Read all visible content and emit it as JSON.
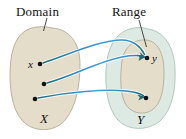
{
  "figure": {
    "type": "mapping-diagram",
    "title_labels": {
      "domain": "Domain",
      "range": "Range"
    },
    "set_labels": {
      "x_set": "X",
      "y_set": "Y"
    },
    "point_labels": {
      "x_point": "x",
      "y_point": "y"
    },
    "colors": {
      "domain_fill": "#e4ddca",
      "domain_stroke": "#b3ab94",
      "codomain_fill": "#dceae3",
      "codomain_stroke": "#a8c4ba",
      "range_fill": "#e4ddca",
      "range_stroke": "#b3ab94",
      "arrow_blue": "#3d9fd6",
      "arrow_teal": "#1d6b75",
      "dot": "#111111",
      "text": "#111111",
      "leader_line": "#333333",
      "background": "#ffffff"
    },
    "dots": {
      "domain": [
        {
          "name": "x",
          "cx": 40,
          "cy": 64
        },
        {
          "name": "mid",
          "cx": 44,
          "cy": 84
        },
        {
          "name": "low",
          "cx": 35,
          "cy": 99
        }
      ],
      "range": [
        {
          "name": "y",
          "cx": 147,
          "cy": 58
        },
        {
          "name": "lower",
          "cx": 146,
          "cy": 98
        }
      ]
    },
    "arrows": [
      {
        "from": "x",
        "to": "y"
      },
      {
        "from": "mid",
        "to": "y"
      },
      {
        "from": "low",
        "to": "lower"
      }
    ]
  }
}
